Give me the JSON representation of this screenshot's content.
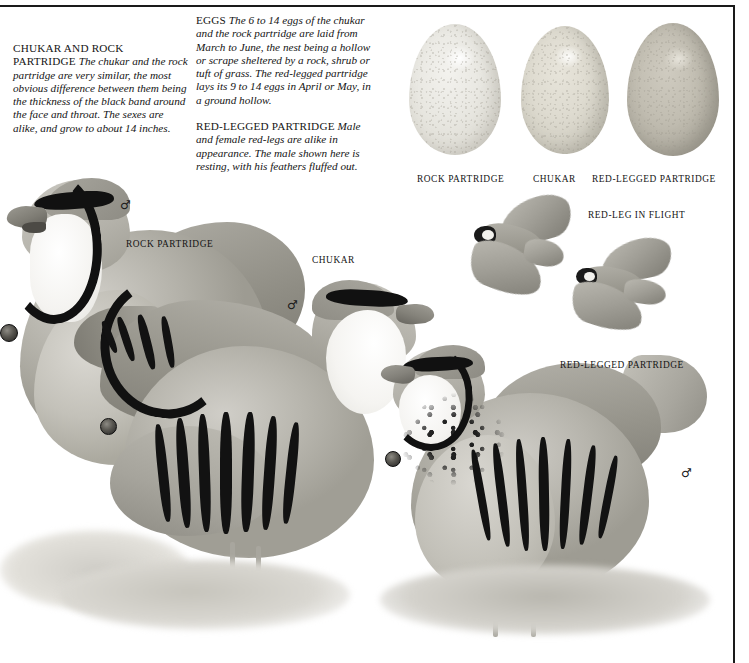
{
  "plate": {
    "title": "Chukar and Rock Partridge plate",
    "frame_color": "#1a1a1a",
    "background": "#ffffff"
  },
  "text_blocks": [
    {
      "id": "chukar-and-rock",
      "lead": "CHUKAR AND ROCK PARTRIDGE",
      "body": "The chukar and the rock partridge are very similar, the most obvious difference between them being the thickness of the black band around the face and throat. The sexes are alike, and grow to about 14 inches."
    },
    {
      "id": "eggs",
      "lead": "EGGS",
      "body": "The 6 to 14 eggs of the chukar and the rock partridge are laid from March to June, the nest being a hollow or scrape sheltered by a rock, shrub or tuft of grass. The red-legged partridge lays its 9 to 14 eggs in April or May, in a ground hollow."
    },
    {
      "id": "red-legged",
      "lead": "RED-LEGGED PARTRIDGE",
      "body": "Male and female red-legs are alike in appearance. The male shown here is resting, with his feathers fluffed out."
    }
  ],
  "eggs": [
    {
      "label": "ROCK PARTRIDGE",
      "color": "#e9e8e2"
    },
    {
      "label": "CHUKAR",
      "color": "#dedbd0"
    },
    {
      "label": "RED-LEGGED PARTRIDGE",
      "color": "#c2beb2"
    }
  ],
  "labels": {
    "rock_partridge": "ROCK PARTRIDGE",
    "chukar": "CHUKAR",
    "red_leg_in_flight": "RED-LEG IN FLIGHT",
    "red_legged_partridge": "RED-LEGGED PARTRIDGE"
  },
  "symbols": {
    "male": "♂"
  }
}
